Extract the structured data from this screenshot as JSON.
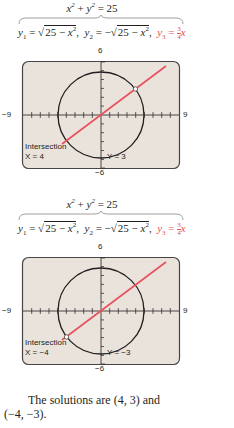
{
  "figures": [
    {
      "equation_top": "x² + y² = 25",
      "y1": "y₁ = √(25 − x²)",
      "y2": "y₂ = −√(25 − x²)",
      "y3": "y₃ = (3/4)x",
      "y3_num": "3",
      "y3_den": "4",
      "window": {
        "xmin": "−9",
        "xmax": "9",
        "ymin": "−6",
        "ymax": "6"
      },
      "screen": {
        "title": "Intersection",
        "x_readout": "X = 4",
        "y_readout": "Y = 3"
      },
      "marked_point": [
        4,
        3
      ]
    },
    {
      "equation_top": "x² + y² = 25",
      "y1": "y₁ = √(25 − x²)",
      "y2": "y₂ = −√(25 − x²)",
      "y3": "y₃ = (3/4)x",
      "y3_num": "3",
      "y3_den": "4",
      "window": {
        "xmin": "−9",
        "xmax": "9",
        "ymin": "−6",
        "ymax": "6"
      },
      "screen": {
        "title": "Intersection",
        "x_readout": "X = −4",
        "y_readout": "Y = −3"
      },
      "marked_point": [
        -4,
        -3
      ]
    }
  ],
  "text": {
    "solutions_line1": "The solutions are (4, 3) and",
    "solutions_line2": "(−4, −3)."
  },
  "colors": {
    "line_color": "#e8515a",
    "circle_color": "#231f20",
    "screen_bg": "#e9e3dc",
    "frame_color": "#4a4545"
  }
}
